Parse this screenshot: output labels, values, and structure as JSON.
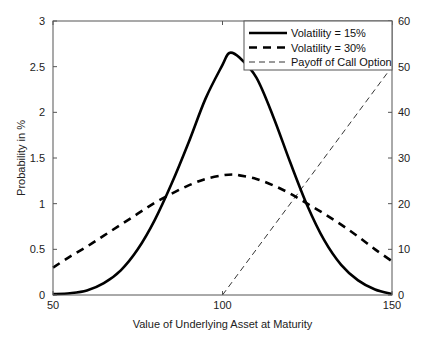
{
  "chart_data": {
    "type": "line",
    "title": "",
    "xlabel": "Value of Underlying Asset at Maturity",
    "ylabel": "Probability in %",
    "xlim": [
      50,
      150
    ],
    "ylim": [
      0,
      3
    ],
    "y2lim": [
      0,
      60
    ],
    "xticks": [
      50,
      100,
      150
    ],
    "yticks": [
      0,
      0.5,
      1,
      1.5,
      2,
      2.5,
      3
    ],
    "y2ticks": [
      0,
      10,
      20,
      30,
      40,
      50,
      60
    ],
    "xtick_labels": [
      "50",
      "100",
      "150"
    ],
    "ytick_labels": [
      "0",
      "0.5",
      "1",
      "1.5",
      "2",
      "2.5",
      "3"
    ],
    "y2tick_labels": [
      "0",
      "10",
      "20",
      "30",
      "40",
      "50",
      "60"
    ],
    "grid": false,
    "legend_position": "top-right",
    "series": [
      {
        "name": "Volatility = 15%",
        "axis": "left",
        "style": "solid-thick",
        "color": "#000000",
        "x": [
          50,
          55,
          60,
          65,
          70,
          75,
          80,
          85,
          90,
          95,
          100,
          102,
          105,
          110,
          115,
          120,
          125,
          130,
          135,
          140,
          145,
          150
        ],
        "values": [
          0.01,
          0.02,
          0.05,
          0.13,
          0.27,
          0.5,
          0.82,
          1.22,
          1.67,
          2.15,
          2.52,
          2.65,
          2.6,
          2.38,
          1.95,
          1.45,
          0.98,
          0.6,
          0.33,
          0.16,
          0.06,
          0.01
        ]
      },
      {
        "name": "Volatility = 30%",
        "axis": "left",
        "style": "dashed-thick",
        "color": "#000000",
        "x": [
          50,
          55,
          60,
          65,
          70,
          75,
          80,
          85,
          90,
          95,
          100,
          103,
          105,
          110,
          115,
          120,
          125,
          130,
          135,
          140,
          145,
          150
        ],
        "values": [
          0.3,
          0.42,
          0.53,
          0.65,
          0.77,
          0.89,
          1.01,
          1.11,
          1.2,
          1.27,
          1.31,
          1.32,
          1.31,
          1.27,
          1.2,
          1.11,
          1.0,
          0.89,
          0.77,
          0.64,
          0.5,
          0.37
        ]
      },
      {
        "name": "Payoff of Call Option",
        "axis": "right",
        "style": "dashed-thin",
        "color": "#000000",
        "x": [
          100,
          150
        ],
        "values": [
          0,
          50
        ]
      }
    ]
  }
}
